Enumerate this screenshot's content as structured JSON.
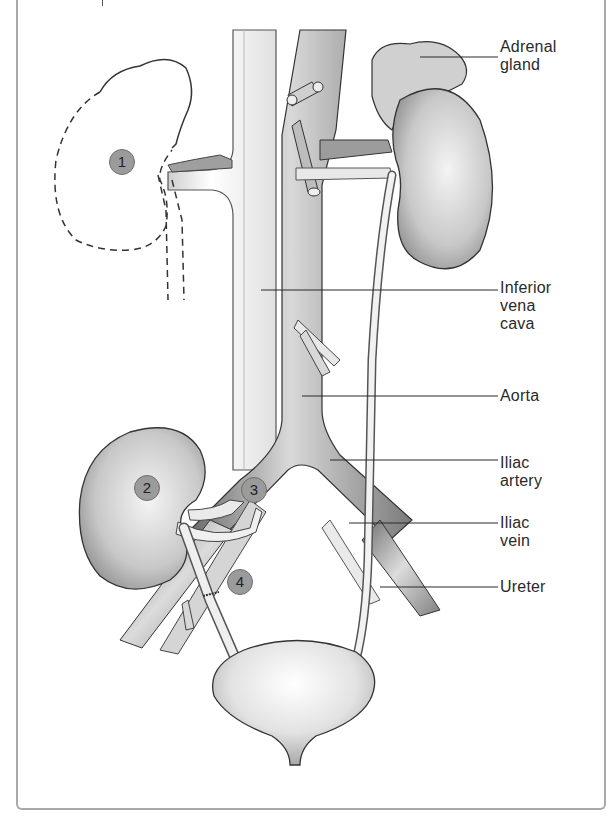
{
  "figure": {
    "labels": [
      {
        "id": "adrenal-gland",
        "text": "Adrenal\ngland",
        "y": 38
      },
      {
        "id": "inferior-vena-cava",
        "text": "Inferior\nvena\ncava",
        "y": 279
      },
      {
        "id": "aorta",
        "text": "Aorta",
        "y": 387
      },
      {
        "id": "iliac-artery",
        "text": "Iliac\nartery",
        "y": 454
      },
      {
        "id": "iliac-vein",
        "text": "Iliac\nvein",
        "y": 514
      },
      {
        "id": "ureter",
        "text": "Ureter",
        "y": 578
      }
    ],
    "markers": [
      {
        "number": "1",
        "x": 109,
        "y": 149
      },
      {
        "number": "2",
        "x": 134,
        "y": 475
      },
      {
        "number": "3",
        "x": 241,
        "y": 477
      },
      {
        "number": "4",
        "x": 227,
        "y": 569
      }
    ]
  },
  "colors": {
    "frame": "#a9a9a9",
    "marker_fill": "#9b9b9b",
    "line": "#2a2a2a",
    "organ_shade": "#bdbdbd"
  }
}
